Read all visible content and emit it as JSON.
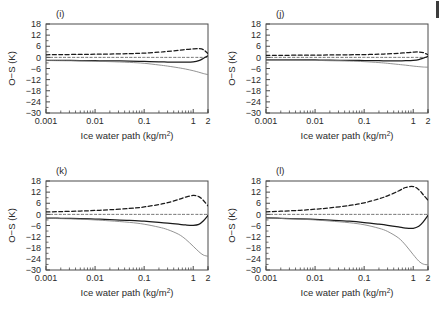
{
  "figure": {
    "layout": "2x2",
    "panels": [
      "i",
      "j",
      "k",
      "l"
    ]
  },
  "axes": {
    "xlabel": "Ice water path (kg/m",
    "xlabel_sup": "2",
    "xlabel_tail": ")",
    "ylabel": "O−S (K)",
    "xticklabels": [
      "0.001",
      "0.01",
      "0.1",
      "1",
      "2"
    ],
    "yticklabels": [
      "18",
      "12",
      "6",
      "0",
      "−6",
      "−12",
      "−18",
      "−24",
      "−30"
    ],
    "xscale": "log",
    "xlim": [
      0.001,
      2
    ],
    "ylim": [
      -30,
      18
    ]
  },
  "chart_data": [
    {
      "type": "line",
      "panel_label": "(i)",
      "title": "",
      "xlabel": "Ice water path (kg/m2)",
      "ylabel": "O−S (K)",
      "xscale": "log",
      "xlim": [
        0.001,
        2
      ],
      "ylim": [
        -30,
        18
      ],
      "grid": false,
      "legend": "none",
      "x": [
        0.001,
        0.002,
        0.005,
        0.01,
        0.02,
        0.05,
        0.1,
        0.2,
        0.3,
        0.5,
        0.7,
        1.0,
        1.3,
        1.6,
        2.0
      ],
      "series": [
        {
          "name": "upper-dashed",
          "style": "dashed",
          "width": "thick",
          "color": "#1a1a1a",
          "values": [
            1.4,
            1.5,
            1.6,
            1.7,
            1.8,
            2.0,
            2.3,
            2.8,
            3.2,
            3.8,
            4.2,
            4.6,
            4.7,
            4.2,
            2.0
          ]
        },
        {
          "name": "zero-reference",
          "style": "dashed",
          "width": "thin",
          "color": "#555555",
          "values": [
            0,
            0,
            0,
            0,
            0,
            0,
            0,
            0,
            0,
            0,
            0,
            0,
            0,
            0,
            0
          ]
        },
        {
          "name": "mid-solid",
          "style": "solid",
          "width": "thick",
          "color": "#1a1a1a",
          "values": [
            -1.6,
            -1.6,
            -1.7,
            -1.8,
            -1.9,
            -2.0,
            -2.2,
            -2.4,
            -2.5,
            -2.6,
            -2.6,
            -2.4,
            -1.8,
            -0.6,
            0.9
          ]
        },
        {
          "name": "lower-solid",
          "style": "solid",
          "width": "thin",
          "color": "#808080",
          "values": [
            -1.7,
            -1.8,
            -1.9,
            -2.1,
            -2.3,
            -2.7,
            -3.2,
            -4.1,
            -4.7,
            -5.6,
            -6.3,
            -7.2,
            -8.0,
            -8.7,
            -9.3
          ]
        }
      ]
    },
    {
      "type": "line",
      "panel_label": "(j)",
      "title": "",
      "xlabel": "Ice water path (kg/m2)",
      "ylabel": "O−S (K)",
      "xscale": "log",
      "xlim": [
        0.001,
        2
      ],
      "ylim": [
        -30,
        18
      ],
      "grid": false,
      "legend": "none",
      "x": [
        0.001,
        0.002,
        0.005,
        0.01,
        0.02,
        0.05,
        0.1,
        0.2,
        0.3,
        0.5,
        0.7,
        1.0,
        1.3,
        1.6,
        2.0
      ],
      "series": [
        {
          "name": "upper-dashed",
          "style": "dashed",
          "width": "thick",
          "color": "#1a1a1a",
          "values": [
            1.1,
            1.1,
            1.2,
            1.2,
            1.3,
            1.4,
            1.5,
            1.7,
            1.9,
            2.2,
            2.5,
            2.8,
            2.9,
            2.6,
            1.4
          ]
        },
        {
          "name": "zero-reference",
          "style": "dashed",
          "width": "thin",
          "color": "#555555",
          "values": [
            0,
            0,
            0,
            0,
            0,
            0,
            0,
            0,
            0,
            0,
            0,
            0,
            0,
            0,
            0
          ]
        },
        {
          "name": "mid-solid",
          "style": "solid",
          "width": "thick",
          "color": "#1a1a1a",
          "values": [
            -1.3,
            -1.3,
            -1.4,
            -1.4,
            -1.5,
            -1.6,
            -1.7,
            -1.8,
            -1.9,
            -1.9,
            -1.8,
            -1.6,
            -1.2,
            -0.4,
            0.5
          ]
        },
        {
          "name": "lower-solid",
          "style": "solid",
          "width": "thin",
          "color": "#808080",
          "values": [
            -1.4,
            -1.4,
            -1.5,
            -1.6,
            -1.8,
            -2.0,
            -2.3,
            -2.8,
            -3.2,
            -3.8,
            -4.2,
            -4.7,
            -5.0,
            -5.2,
            -5.3
          ]
        }
      ]
    },
    {
      "type": "line",
      "panel_label": "(k)",
      "title": "",
      "xlabel": "Ice water path (kg/m2)",
      "ylabel": "O−S (K)",
      "xscale": "log",
      "xlim": [
        0.001,
        2
      ],
      "ylim": [
        -30,
        18
      ],
      "grid": false,
      "legend": "none",
      "x": [
        0.001,
        0.002,
        0.005,
        0.01,
        0.02,
        0.05,
        0.1,
        0.2,
        0.3,
        0.5,
        0.7,
        1.0,
        1.3,
        1.6,
        2.0
      ],
      "series": [
        {
          "name": "upper-dashed",
          "style": "dashed",
          "width": "thick",
          "color": "#1a1a1a",
          "values": [
            1.3,
            1.5,
            1.8,
            2.1,
            2.5,
            3.2,
            4.0,
            5.3,
            6.3,
            8.0,
            9.3,
            10.2,
            9.6,
            7.6,
            4.6
          ]
        },
        {
          "name": "zero-reference",
          "style": "dashed",
          "width": "thin",
          "color": "#555555",
          "values": [
            0,
            0,
            0,
            0,
            0,
            0,
            0,
            0,
            0,
            0,
            0,
            0,
            0,
            0,
            0
          ]
        },
        {
          "name": "mid-solid",
          "style": "solid",
          "width": "thick",
          "color": "#1a1a1a",
          "values": [
            -2.0,
            -2.1,
            -2.3,
            -2.5,
            -2.8,
            -3.2,
            -3.7,
            -4.3,
            -4.7,
            -5.3,
            -5.7,
            -5.9,
            -5.4,
            -3.6,
            -0.6
          ]
        },
        {
          "name": "lower-solid",
          "style": "solid",
          "width": "thin",
          "color": "#808080",
          "values": [
            -2.1,
            -2.3,
            -2.6,
            -3.0,
            -3.5,
            -4.3,
            -5.3,
            -6.9,
            -8.2,
            -10.7,
            -13.4,
            -17.2,
            -20.1,
            -21.9,
            -22.6
          ]
        }
      ]
    },
    {
      "type": "line",
      "panel_label": "(l)",
      "title": "",
      "xlabel": "Ice water path (kg/m2)",
      "ylabel": "O−S (K)",
      "xscale": "log",
      "xlim": [
        0.001,
        2
      ],
      "ylim": [
        -30,
        18
      ],
      "grid": false,
      "legend": "none",
      "x": [
        0.001,
        0.002,
        0.005,
        0.01,
        0.02,
        0.05,
        0.1,
        0.2,
        0.3,
        0.5,
        0.7,
        1.0,
        1.3,
        1.6,
        2.0
      ],
      "series": [
        {
          "name": "upper-dashed",
          "style": "dashed",
          "width": "thick",
          "color": "#1a1a1a",
          "values": [
            1.4,
            1.7,
            2.2,
            2.8,
            3.5,
            4.8,
            6.2,
            8.4,
            10.0,
            12.6,
            14.5,
            15.0,
            13.3,
            10.6,
            7.6
          ]
        },
        {
          "name": "zero-reference",
          "style": "dashed",
          "width": "thin",
          "color": "#555555",
          "values": [
            0,
            0,
            0,
            0,
            0,
            0,
            0,
            0,
            0,
            0,
            0,
            0,
            0,
            0,
            0
          ]
        },
        {
          "name": "mid-solid",
          "style": "solid",
          "width": "thick",
          "color": "#1a1a1a",
          "values": [
            -1.9,
            -2.1,
            -2.4,
            -2.7,
            -3.1,
            -3.7,
            -4.4,
            -5.3,
            -5.9,
            -6.8,
            -7.4,
            -7.5,
            -6.4,
            -4.0,
            -0.5
          ]
        },
        {
          "name": "lower-solid",
          "style": "solid",
          "width": "thin",
          "color": "#808080",
          "values": [
            -2.0,
            -2.2,
            -2.6,
            -3.0,
            -3.6,
            -4.5,
            -5.6,
            -7.5,
            -9.2,
            -12.7,
            -16.6,
            -21.7,
            -25.2,
            -26.8,
            -27.2
          ]
        }
      ]
    }
  ]
}
